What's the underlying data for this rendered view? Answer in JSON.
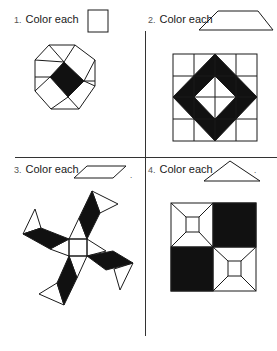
{
  "worksheet": {
    "problems": [
      {
        "number": "1.",
        "instruction": "Color each",
        "shape": "square"
      },
      {
        "number": "2.",
        "instruction": "Color each",
        "shape": "trapezoid"
      },
      {
        "number": "3.",
        "instruction": "Color each",
        "shape": "parallelogram",
        "suffix": "."
      },
      {
        "number": "4.",
        "instruction": "Color each",
        "shape": "triangle",
        "suffix": "."
      }
    ]
  },
  "colors": {
    "ink": "#1a1a1a",
    "fill": "#111111",
    "paper": "#ffffff"
  }
}
